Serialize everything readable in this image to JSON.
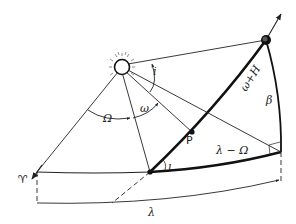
{
  "diagram": {
    "type": "orbital-elements-celestial-sphere",
    "labels": {
      "ascending_node_longitude": "Ω",
      "argument_of_perihelion": "ω",
      "inclination_at_sun": "i",
      "inclination_at_node": "ι",
      "arc_omega_plus_H": "ω+H",
      "latitude": "β",
      "point": "P",
      "arc_lambda_minus_omega": "λ − Ω",
      "longitude": "λ",
      "vernal_equinox": "♈"
    },
    "colors": {
      "ink": "#222222",
      "background": "#ffffff"
    }
  }
}
